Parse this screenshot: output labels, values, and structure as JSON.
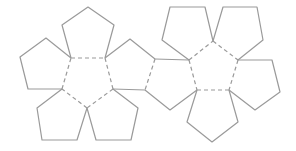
{
  "diagram": {
    "title": "Dodecahedron net",
    "colors": {
      "line": "#9a9a9a",
      "background": "#ffffff"
    },
    "face_count": 12,
    "faces": [
      {
        "id": "left-center",
        "points": "71,58 105,58 113,89 87,108 62,89"
      },
      {
        "id": "left-top",
        "points": "71,58 62,25 88,7 114,25 105,58"
      },
      {
        "id": "left-left",
        "points": "71,58 46,38 20,57 28,89 62,89"
      },
      {
        "id": "left-bottom-left",
        "points": "62,89 37,108 42,140 77,140 87,108"
      },
      {
        "id": "left-bottom-right",
        "points": "87,108 96,140 131,140 138,108 113,89"
      },
      {
        "id": "left-right",
        "points": "105,58 130,39 155,59 145,90 113,89"
      },
      {
        "id": "bridge",
        "points": "155,59 189,60 197,90 170,110 145,90"
      },
      {
        "id": "right-center",
        "points": "213,41 238,60 229,90 197,90 189,60"
      },
      {
        "id": "right-top-left",
        "points": "189,60 162,40 170,7 205,7 213,41"
      },
      {
        "id": "right-top-right",
        "points": "213,41 223,7 257,7 263,40 238,60"
      },
      {
        "id": "right-right",
        "points": "238,60 272,60 280,92 255,110 229,90"
      },
      {
        "id": "right-bottom",
        "points": "197,90 229,90 238,122 212,142 187,122"
      }
    ],
    "cut_paths": [
      "M71,58 L62,25 L88,7 L114,25 L105,58",
      "M71,58 L46,38 L20,57 L28,89 L62,89",
      "M62,89 L37,108 L42,140 L77,140 L87,108",
      "M87,108 L96,140 L131,140 L138,108 L113,89",
      "M105,58 L130,39 L155,59",
      "M113,89 L145,90",
      "M155,59 L189,60",
      "M145,90 L170,110 L197,90",
      "M189,60 L162,40 L170,7 L205,7 L213,41",
      "M213,41 L223,7 L257,7 L263,40 L238,60",
      "M238,60 L272,60 L280,92 L255,110 L229,90",
      "M197,90 L187,122 L212,142 L238,122 L229,90"
    ],
    "fold_paths": [
      "M71,58 L105,58",
      "M105,58 L113,89",
      "M113,89 L87,108",
      "M87,108 L62,89",
      "M62,89 L71,58",
      "M155,59 L145,90",
      "M189,60 L197,90",
      "M189,60 L213,41",
      "M213,41 L238,60",
      "M238,60 L229,90",
      "M229,90 L197,90"
    ]
  }
}
